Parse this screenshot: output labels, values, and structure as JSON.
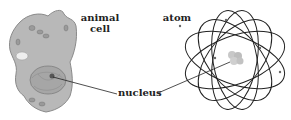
{
  "diagram": {
    "labels": {
      "animal_cell_line1": "animal",
      "animal_cell_line2": "cell",
      "atom": "atom",
      "nucleus": "nucleus"
    },
    "figures": [
      {
        "name": "animal-cell",
        "fill": "#bdbdbd"
      },
      {
        "name": "atom",
        "stroke": "#222222",
        "orbits": 6
      }
    ]
  }
}
